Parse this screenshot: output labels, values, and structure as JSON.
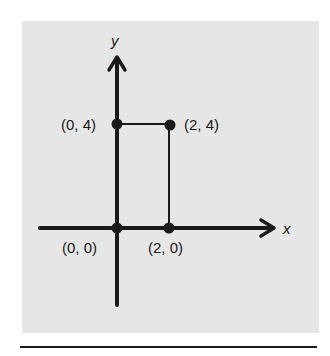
{
  "diagram": {
    "type": "coordinate-plane",
    "axes": {
      "x_label": "x",
      "y_label": "y"
    },
    "points": [
      {
        "label": "(0, 0)",
        "x": 0,
        "y": 0
      },
      {
        "label": "(2, 0)",
        "x": 2,
        "y": 0
      },
      {
        "label": "(0, 4)",
        "x": 0,
        "y": 4
      },
      {
        "label": "(2, 4)",
        "x": 2,
        "y": 4
      }
    ],
    "segments": [
      {
        "from": "(0, 4)",
        "to": "(2, 4)"
      },
      {
        "from": "(2, 4)",
        "to": "(2, 0)"
      }
    ],
    "colors": {
      "background": "#e6e6e6",
      "ink": "#1a1a1a",
      "page": "#ffffff"
    }
  }
}
